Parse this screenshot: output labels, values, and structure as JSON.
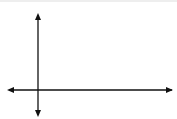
{
  "diagram": {
    "type": "coordinate-plane",
    "axes": {
      "x_label": "x",
      "y_label": "y",
      "x_ticks": [
        {
          "value": 2,
          "label": "2"
        },
        {
          "value": 4,
          "label": "4"
        },
        {
          "value": 6,
          "label": "6"
        },
        {
          "value": 8,
          "label": "8"
        }
      ],
      "y_ticks": [
        {
          "value": 2,
          "label": "2"
        },
        {
          "value": 4,
          "label": "4"
        }
      ],
      "x_range": [
        -2,
        9.75
      ],
      "y_range": [
        -1.8,
        5.8
      ]
    },
    "triangle": {
      "color": "#8c8c8c",
      "vertices": [
        {
          "name": "D'",
          "x": 3,
          "y": 4
        },
        {
          "name": "E'",
          "x": 9,
          "y": 5
        },
        {
          "name": "F'",
          "x": 8,
          "y": 1
        }
      ]
    },
    "colors": {
      "grid": "#c8c8c8",
      "axes": "#111111",
      "shape": "#8c8c8c"
    }
  }
}
